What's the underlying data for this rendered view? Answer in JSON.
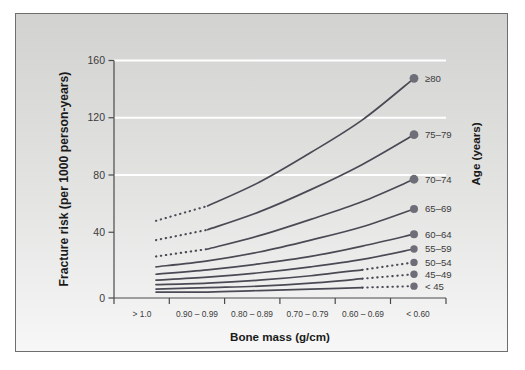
{
  "figure": {
    "panel_background": "#dededd",
    "plot_background_top": "#d2d2d1",
    "plot_background_bottom": "#f4f4f4",
    "gridline_color": "#ffffff",
    "axis_color": "#4a4a4a",
    "curve_color": "#4a4a55",
    "marker_color": "#6e6e78"
  },
  "chart_data": {
    "type": "line",
    "title": "",
    "xlabel": "Bone mass (g/cm)",
    "ylabel": "Fracture risk (per 1000 person-years)",
    "legend_title": "Age (years)",
    "legend_position": "right",
    "grid": true,
    "categories": [
      "> 1.0",
      "0.90 – 0.99",
      "0.80 – 0.89",
      "0.70 – 0.79",
      "0.60 – 0.69",
      "< 0.60"
    ],
    "ylim": [
      0,
      160
    ],
    "yticks": [
      0,
      40,
      80,
      120,
      160
    ],
    "ytick_labels": [
      "0",
      "40",
      "80",
      "120",
      "160"
    ],
    "series": [
      {
        "name": "≥80",
        "values": [
          52,
          62,
          78,
          98,
          120,
          148
        ],
        "dashed_segment": "left",
        "endpoint_marker": true
      },
      {
        "name": "75–79",
        "values": [
          39,
          46,
          58,
          73,
          90,
          110
        ],
        "dashed_segment": "left",
        "endpoint_marker": true
      },
      {
        "name": "70–74",
        "values": [
          28,
          33,
          42,
          53,
          65,
          80
        ],
        "dashed_segment": "left",
        "endpoint_marker": true
      },
      {
        "name": "65–69",
        "values": [
          21,
          25,
          31,
          39,
          48,
          60
        ],
        "dashed_segment": "none",
        "endpoint_marker": true
      },
      {
        "name": "60–64",
        "values": [
          16,
          19,
          23,
          28,
          35,
          43
        ],
        "dashed_segment": "none",
        "endpoint_marker": true
      },
      {
        "name": "55–59",
        "values": [
          12,
          14,
          17,
          21,
          26,
          33
        ],
        "dashed_segment": "none",
        "endpoint_marker": true
      },
      {
        "name": "50–54",
        "values": [
          9,
          10,
          12,
          15,
          19,
          24
        ],
        "dashed_segment": "right",
        "endpoint_marker": true
      },
      {
        "name": "45–49",
        "values": [
          6,
          7,
          8,
          10,
          13,
          16
        ],
        "dashed_segment": "right",
        "endpoint_marker": true
      },
      {
        "name": "< 45",
        "values": [
          4,
          4,
          5,
          6,
          7,
          8
        ],
        "dashed_segment": "right",
        "endpoint_marker": true
      }
    ]
  }
}
